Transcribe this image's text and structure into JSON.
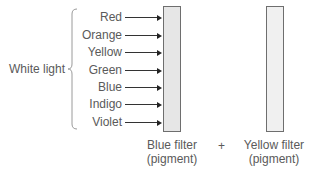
{
  "diagram": {
    "source_label": "White light",
    "colors": [
      "Red",
      "Orange",
      "Yellow",
      "Green",
      "Blue",
      "Indigo",
      "Violet"
    ],
    "filters": [
      {
        "name": "Blue filter",
        "sub": "(pigment)",
        "fill": "#e6e6e6"
      },
      {
        "name": "Yellow filter",
        "sub": "(pigment)",
        "fill": "#f0f0f0"
      }
    ],
    "operator": "+"
  }
}
